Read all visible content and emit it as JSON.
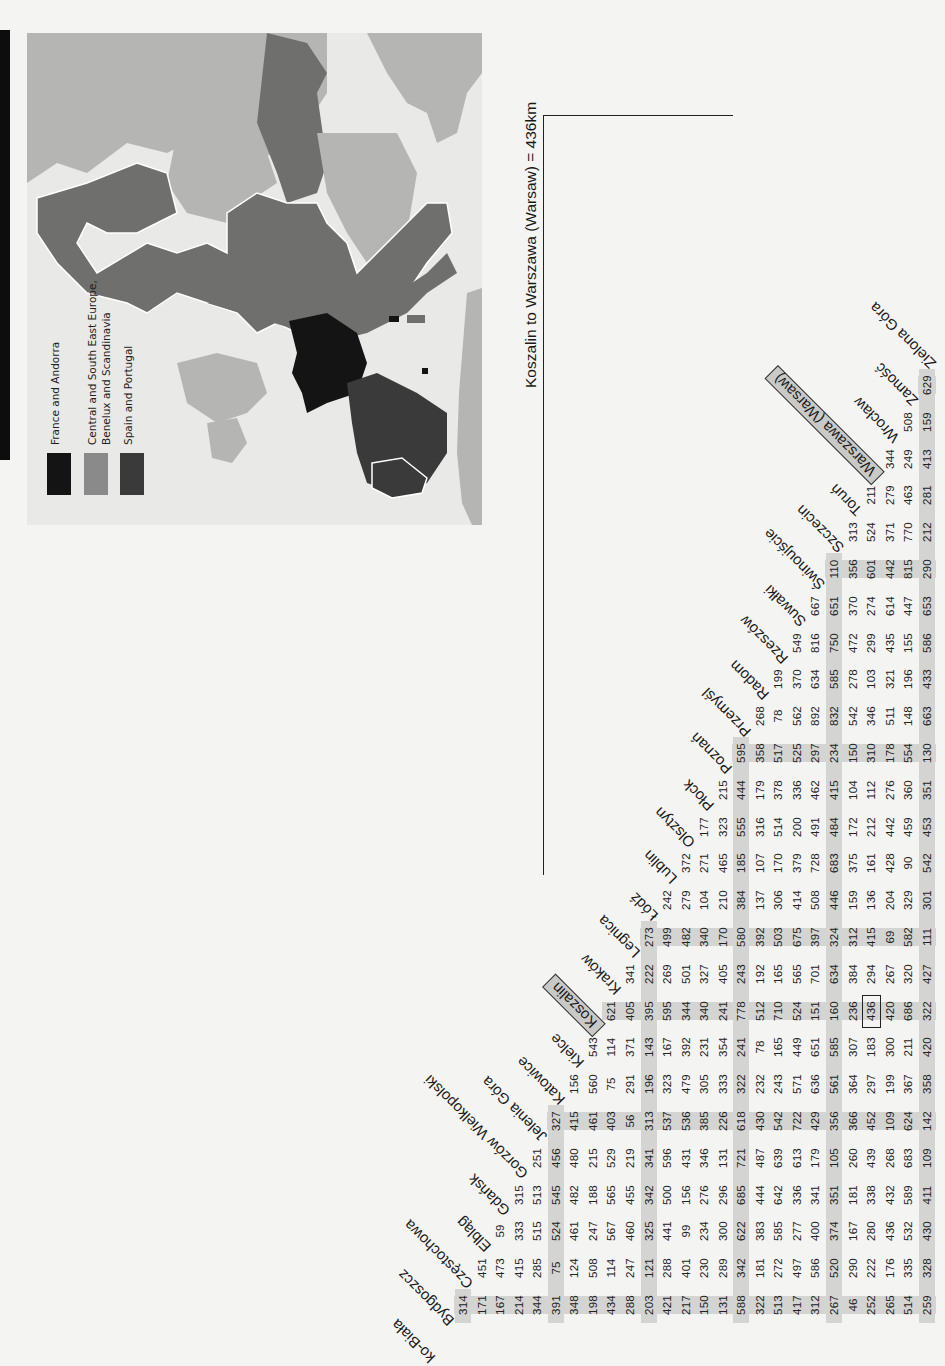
{
  "page": {
    "orientation": "rotated-90-ccw",
    "side_tab_color": "#0d0d0d"
  },
  "map": {
    "legend": [
      {
        "label": "France and Andorra",
        "color": "#141414"
      },
      {
        "label": "Central and South East Europe,",
        "label2": "Benelux and Scandinavia",
        "color": "#8a8a8a"
      },
      {
        "label": "Spain and Portugal",
        "color": "#3a3a3a"
      }
    ],
    "colors": {
      "sea": "#e9e9e7",
      "light_land": "#b5b5b3",
      "mid_land": "#6f6f6d",
      "border": "#ffffff"
    }
  },
  "annotation": {
    "text": "Koszalin to Warszawa (Warsaw) = 436km",
    "from_city": "Koszalin",
    "to_city": "Warszawa (Warsaw)",
    "distance_km": 436
  },
  "distance_table": {
    "title_cut_city": "ko-Biała",
    "cities": [
      "Bydgoszcz",
      "Częstochowa",
      "Elbląg",
      "Gdańsk",
      "Gorzów Wielkopolski",
      "Jelenia Góra",
      "Katowice",
      "Kielce",
      "Koszalin",
      "Kraków",
      "Legnica",
      "Łódź",
      "Lublin",
      "Olsztyn",
      "Płock",
      "Poznań",
      "Przemyśl",
      "Radom",
      "Rzeszów",
      "Suwałki",
      "Świnoujście",
      "Szczecin",
      "Toruń",
      "Warszawa (Warsaw)",
      "Wrocław",
      "Zamość",
      "Zielona Góra"
    ],
    "highlight_city": "Koszalin",
    "highlight_value": {
      "col": "Koszalin",
      "row": "Warszawa (Warsaw)",
      "value": 436
    },
    "columns": [
      {
        "city": "Bydgoszcz",
        "values": [
          314,
          171,
          167,
          214,
          344,
          391,
          348,
          198,
          434,
          288,
          203,
          421,
          217,
          150,
          131,
          588,
          322,
          513,
          417,
          312,
          267,
          46,
          252,
          265,
          514,
          259
        ]
      },
      {
        "city": "Częstochowa",
        "values": [
          451,
          473,
          415,
          285,
          75,
          124,
          508,
          114,
          247,
          121,
          288,
          401,
          230,
          289,
          342,
          181,
          272,
          497,
          586,
          520,
          290,
          222,
          176,
          335,
          328
        ]
      },
      {
        "city": "Elbląg",
        "values": [
          59,
          333,
          515,
          524,
          461,
          247,
          567,
          460,
          325,
          441,
          99,
          234,
          300,
          622,
          383,
          585,
          277,
          400,
          374,
          167,
          280,
          436,
          532,
          430
        ]
      },
      {
        "city": "Gdańsk",
        "values": [
          315,
          513,
          545,
          482,
          188,
          565,
          455,
          342,
          500,
          156,
          276,
          296,
          685,
          444,
          642,
          336,
          341,
          351,
          181,
          338,
          432,
          589,
          411
        ]
      },
      {
        "city": "Gorzów Wielkopolski",
        "values": [
          251,
          456,
          480,
          215,
          529,
          219,
          341,
          596,
          431,
          346,
          131,
          721,
          487,
          639,
          613,
          179,
          105,
          260,
          439,
          268,
          683,
          109
        ]
      },
      {
        "city": "Jelenia Góra",
        "values": [
          327,
          415,
          461,
          403,
          56,
          313,
          537,
          536,
          385,
          226,
          618,
          430,
          542,
          722,
          429,
          356,
          366,
          452,
          109,
          624,
          142
        ]
      },
      {
        "city": "Katowice",
        "values": [
          156,
          560,
          75,
          291,
          196,
          323,
          479,
          305,
          333,
          322,
          232,
          243,
          571,
          636,
          561,
          364,
          297,
          199,
          367,
          358
        ]
      },
      {
        "city": "Kielce",
        "values": [
          543,
          114,
          371,
          143,
          167,
          392,
          231,
          354,
          241,
          78,
          165,
          449,
          651,
          585,
          307,
          183,
          300,
          211,
          420
        ]
      },
      {
        "city": "Koszalin",
        "values": [
          621,
          405,
          395,
          595,
          344,
          340,
          241,
          778,
          512,
          710,
          524,
          151,
          160,
          236,
          436,
          420,
          686,
          322
        ]
      },
      {
        "city": "Kraków",
        "values": [
          341,
          222,
          269,
          501,
          327,
          405,
          243,
          192,
          165,
          565,
          701,
          634,
          384,
          294,
          267,
          320,
          427
        ]
      },
      {
        "city": "Legnica",
        "values": [
          273,
          499,
          482,
          340,
          170,
          580,
          392,
          503,
          675,
          397,
          324,
          312,
          415,
          69,
          582,
          111
        ]
      },
      {
        "city": "Łódź",
        "values": [
          242,
          279,
          104,
          210,
          384,
          137,
          306,
          414,
          508,
          446,
          159,
          136,
          204,
          329,
          301
        ]
      },
      {
        "city": "Lublin",
        "values": [
          372,
          271,
          465,
          185,
          107,
          170,
          379,
          728,
          683,
          375,
          161,
          428,
          90,
          542
        ]
      },
      {
        "city": "Olsztyn",
        "values": [
          177,
          323,
          555,
          316,
          514,
          200,
          491,
          484,
          172,
          212,
          442,
          459,
          453
        ]
      },
      {
        "city": "Płock",
        "values": [
          215,
          444,
          179,
          378,
          336,
          462,
          415,
          104,
          112,
          276,
          360,
          351
        ]
      },
      {
        "city": "Poznań",
        "values": [
          595,
          358,
          517,
          525,
          297,
          234,
          150,
          310,
          178,
          554,
          130
        ]
      },
      {
        "city": "Przemyśl",
        "values": [
          268,
          78,
          562,
          892,
          832,
          542,
          346,
          511,
          148,
          663
        ]
      },
      {
        "city": "Radom",
        "values": [
          199,
          370,
          634,
          585,
          278,
          103,
          321,
          196,
          433
        ]
      },
      {
        "city": "Rzeszów",
        "values": [
          549,
          816,
          750,
          472,
          299,
          435,
          155,
          586
        ]
      },
      {
        "city": "Suwałki",
        "values": [
          667,
          651,
          370,
          274,
          614,
          447,
          653
        ]
      },
      {
        "city": "Świnoujście",
        "values": [
          110,
          356,
          601,
          442,
          815,
          290
        ]
      },
      {
        "city": "Szczecin",
        "values": [
          313,
          524,
          371,
          770,
          212
        ]
      },
      {
        "city": "Toruń",
        "values": [
          211,
          279,
          463,
          281
        ]
      },
      {
        "city": "Warszawa (Warsaw)",
        "values": [
          344,
          249,
          413
        ]
      },
      {
        "city": "Wrocław",
        "values": [
          508,
          159
        ]
      },
      {
        "city": "Zamość",
        "values": [
          629
        ]
      }
    ],
    "band_color": "#d4d4d2"
  }
}
